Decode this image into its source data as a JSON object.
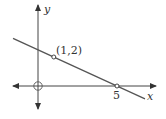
{
  "figure": {
    "type": "coordinate-plane-line",
    "axes": {
      "x_label": "x",
      "y_label": "y",
      "origin_marker": "open-circle",
      "x_tick_label": "5",
      "pixel_origin": [
        38,
        86
      ],
      "px_per_unit_x": 15.8,
      "px_per_unit_y": 14.5,
      "x_axis_px": {
        "from": 13,
        "to": 156
      },
      "y_axis_px": {
        "from": 5,
        "to": 109
      }
    },
    "line": {
      "description": "straight line through (1,2) and (5,0)",
      "slope": -0.5,
      "y_intercept": 2.5,
      "x_range": [
        -1.58,
        6.77
      ],
      "color": "#555555"
    },
    "points": [
      {
        "label": "(1,2)",
        "x": 1,
        "y": 2,
        "marker": "open-circle"
      },
      {
        "label": "5",
        "x": 5,
        "y": 0,
        "marker": "open-circle"
      }
    ],
    "colors": {
      "axis": "#444444",
      "line": "#555555",
      "text": "#333333",
      "background": "#ffffff"
    }
  }
}
